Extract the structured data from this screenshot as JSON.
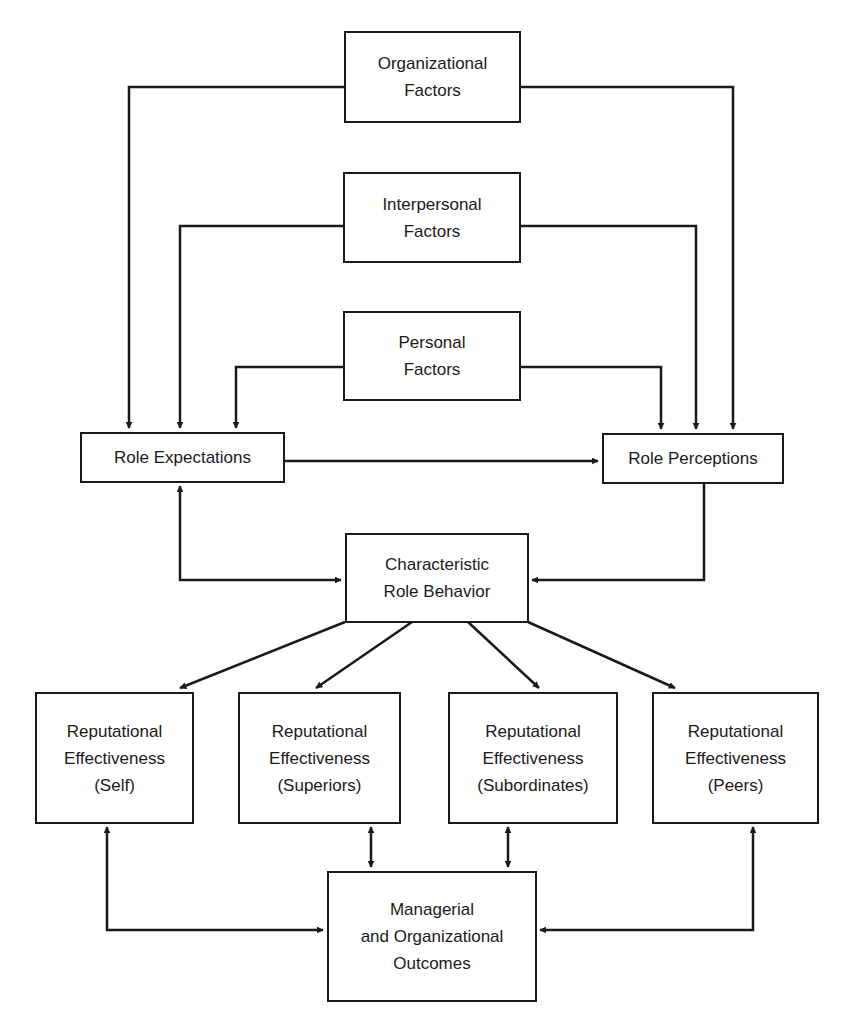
{
  "nodes": {
    "organizational": {
      "lines": [
        "Organizational",
        "Factors"
      ]
    },
    "interpersonal": {
      "lines": [
        "Interpersonal",
        "Factors"
      ]
    },
    "personal": {
      "lines": [
        "Personal",
        "Factors"
      ]
    },
    "role_expectations": {
      "lines": [
        "Role Expectations"
      ]
    },
    "role_perceptions": {
      "lines": [
        "Role Perceptions"
      ]
    },
    "characteristic_role_behavior": {
      "lines": [
        "Characteristic",
        "Role Behavior"
      ]
    },
    "rep_self": {
      "lines": [
        "Reputational",
        "Effectiveness",
        "(Self)"
      ]
    },
    "rep_superiors": {
      "lines": [
        "Reputational",
        "Effectiveness",
        "(Superiors)"
      ]
    },
    "rep_subordinates": {
      "lines": [
        "Reputational",
        "Effectiveness",
        "(Subordinates)"
      ]
    },
    "rep_peers": {
      "lines": [
        "Reputational",
        "Effectiveness",
        "(Peers)"
      ]
    },
    "outcomes": {
      "lines": [
        "Managerial",
        "and Organizational",
        "Outcomes"
      ]
    }
  },
  "edges": [
    {
      "from": "Organizational Factors",
      "to": "Role Expectations",
      "type": "directed"
    },
    {
      "from": "Organizational Factors",
      "to": "Role Perceptions",
      "type": "directed"
    },
    {
      "from": "Interpersonal Factors",
      "to": "Role Expectations",
      "type": "directed"
    },
    {
      "from": "Interpersonal Factors",
      "to": "Role Perceptions",
      "type": "directed"
    },
    {
      "from": "Personal Factors",
      "to": "Role Expectations",
      "type": "directed"
    },
    {
      "from": "Personal Factors",
      "to": "Role Perceptions",
      "type": "directed"
    },
    {
      "from": "Role Expectations",
      "to": "Role Perceptions",
      "type": "directed"
    },
    {
      "from": "Role Expectations",
      "to": "Characteristic Role Behavior",
      "type": "bidirectional"
    },
    {
      "from": "Role Perceptions",
      "to": "Characteristic Role Behavior",
      "type": "directed"
    },
    {
      "from": "Characteristic Role Behavior",
      "to": "Reputational Effectiveness (Self)",
      "type": "directed"
    },
    {
      "from": "Characteristic Role Behavior",
      "to": "Reputational Effectiveness (Superiors)",
      "type": "directed"
    },
    {
      "from": "Characteristic Role Behavior",
      "to": "Reputational Effectiveness (Subordinates)",
      "type": "directed"
    },
    {
      "from": "Characteristic Role Behavior",
      "to": "Reputational Effectiveness (Peers)",
      "type": "directed"
    },
    {
      "from": "Reputational Effectiveness (Self)",
      "to": "Managerial and Organizational Outcomes",
      "type": "bidirectional"
    },
    {
      "from": "Reputational Effectiveness (Superiors)",
      "to": "Managerial and Organizational Outcomes",
      "type": "bidirectional"
    },
    {
      "from": "Reputational Effectiveness (Subordinates)",
      "to": "Managerial and Organizational Outcomes",
      "type": "bidirectional"
    },
    {
      "from": "Reputational Effectiveness (Peers)",
      "to": "Managerial and Organizational Outcomes",
      "type": "bidirectional"
    }
  ],
  "colors": {
    "line": "#1a1a1a",
    "background": "#ffffff"
  }
}
